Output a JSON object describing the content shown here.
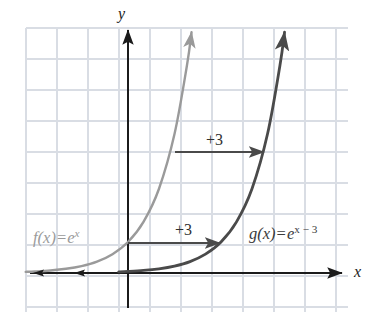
{
  "figure": {
    "width": 376,
    "height": 328,
    "background": "#ffffff"
  },
  "axes": {
    "x_label": "x",
    "y_label": "y",
    "origin_px": {
      "x": 128,
      "y": 273
    },
    "axis_color": "#1b1b1b",
    "x_axis_from_px": 30,
    "x_axis_to_px": 342,
    "y_axis_top_px": 30,
    "y_axis_bottom_px": 308
  },
  "grid": {
    "visible": true,
    "color": "#d9dde4",
    "cell_size_px": 31,
    "left_px": 26,
    "top_px": 28,
    "right_px": 348,
    "bottom_px": 312,
    "columns": 10,
    "rows": 9
  },
  "curves": [
    {
      "id": "f",
      "label_text_parts": {
        "name": "f",
        "arg": "(x)",
        "equals": "=",
        "base": "e",
        "exponent": "x"
      },
      "label_plain": "f(x) = e^x",
      "color": "#9a9a9a",
      "stroke_width": 2.4,
      "y_intercept": 1,
      "has_arrowhead": true,
      "label_pos_px": {
        "x": 33,
        "y": 230
      }
    },
    {
      "id": "g",
      "label_text_parts": {
        "name": "g",
        "arg": "(x)",
        "equals": "=",
        "base": "e",
        "exponent": "x − 3"
      },
      "label_plain": "g(x) = e^(x-3)",
      "color": "#4a4a4a",
      "stroke_width": 2.8,
      "shift_right": 3,
      "has_arrowhead": true,
      "label_pos_px": {
        "x": 249,
        "y": 226
      }
    }
  ],
  "annotations": {
    "shift_arrows": [
      {
        "id": "shift-upper",
        "label": "+3",
        "label_pos_px": {
          "x": 206,
          "y": 132
        },
        "arrow_from_px": {
          "x": 175,
          "y": 152
        },
        "arrow_to_px": {
          "x": 264,
          "y": 152
        },
        "color": "#4a4a4a"
      },
      {
        "id": "shift-lower",
        "label": "+3",
        "label_pos_px": {
          "x": 175,
          "y": 222
        },
        "arrow_from_px": {
          "x": 128,
          "y": 243
        },
        "arrow_to_px": {
          "x": 220,
          "y": 243
        },
        "color": "#4a4a4a"
      }
    ],
    "asymptote_arrows": [
      {
        "id": "asymptote-arrow-f",
        "direction": "left",
        "tip_px": {
          "x": 33,
          "y": 273
        }
      },
      {
        "id": "asymptote-arrow-g",
        "direction": "left",
        "tip_px": {
          "x": 74,
          "y": 273
        }
      }
    ]
  },
  "chart_data": {
    "type": "line",
    "title": "",
    "xlabel": "x",
    "ylabel": "y",
    "grid": true,
    "legend": "inline-labels",
    "unit_px": 31,
    "origin_px": {
      "x": 128,
      "y": 273
    },
    "xlim": [
      -3.3,
      7.1
    ],
    "ylim": [
      -1.3,
      7.9
    ],
    "series": [
      {
        "name": "f(x) = e^x",
        "formula": "e^x",
        "color": "#9a9a9a",
        "points": [
          {
            "x": -3.3,
            "y": 0.037
          },
          {
            "x": -3.0,
            "y": 0.05
          },
          {
            "x": -2.5,
            "y": 0.082
          },
          {
            "x": -2.0,
            "y": 0.135
          },
          {
            "x": -1.5,
            "y": 0.223
          },
          {
            "x": -1.0,
            "y": 0.368
          },
          {
            "x": -0.5,
            "y": 0.607
          },
          {
            "x": 0.0,
            "y": 1.0
          },
          {
            "x": 0.5,
            "y": 1.649
          },
          {
            "x": 1.0,
            "y": 2.718
          },
          {
            "x": 1.5,
            "y": 4.482
          },
          {
            "x": 1.9,
            "y": 6.686
          },
          {
            "x": 2.05,
            "y": 7.77
          }
        ]
      },
      {
        "name": "g(x) = e^(x-3)",
        "formula": "e^(x-3)",
        "color": "#4a4a4a",
        "points": [
          {
            "x": -0.3,
            "y": 0.037
          },
          {
            "x": 0.0,
            "y": 0.05
          },
          {
            "x": 0.5,
            "y": 0.082
          },
          {
            "x": 1.0,
            "y": 0.135
          },
          {
            "x": 1.5,
            "y": 0.223
          },
          {
            "x": 2.0,
            "y": 0.368
          },
          {
            "x": 2.5,
            "y": 0.607
          },
          {
            "x": 3.0,
            "y": 1.0
          },
          {
            "x": 3.5,
            "y": 1.649
          },
          {
            "x": 4.0,
            "y": 2.718
          },
          {
            "x": 4.5,
            "y": 4.482
          },
          {
            "x": 4.9,
            "y": 6.686
          },
          {
            "x": 5.05,
            "y": 7.77
          }
        ]
      }
    ],
    "annotations": [
      {
        "text": "+3",
        "type": "horizontal-shift-arrow",
        "x_from": 1.5,
        "x_to": 4.4,
        "y": 3.9
      },
      {
        "text": "+3",
        "type": "horizontal-shift-arrow",
        "x_from": 0.0,
        "x_to": 3.0,
        "y": 0.97
      }
    ]
  }
}
